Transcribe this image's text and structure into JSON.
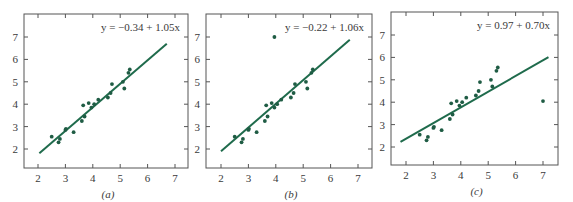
{
  "chart_data": [
    {
      "type": "scatter",
      "panel_label": "(a)",
      "title": "",
      "annotation": "y = −0.34 + 1.05x",
      "xlabel": "",
      "ylabel": "",
      "xlim": [
        1.5,
        7.5
      ],
      "ylim": [
        1.2,
        8.0
      ],
      "xticks": [
        2,
        3,
        4,
        5,
        6,
        7
      ],
      "yticks": [
        2,
        3,
        4,
        5,
        6,
        7
      ],
      "grid": false,
      "fit_line": {
        "intercept": -0.34,
        "slope": 1.05,
        "x_range": [
          2.05,
          6.7
        ]
      },
      "points": [
        [
          2.5,
          2.55
        ],
        [
          2.75,
          2.3
        ],
        [
          2.8,
          2.45
        ],
        [
          3.0,
          2.85
        ],
        [
          3.02,
          2.9
        ],
        [
          3.3,
          2.75
        ],
        [
          3.6,
          3.25
        ],
        [
          3.65,
          3.95
        ],
        [
          3.7,
          3.45
        ],
        [
          3.85,
          4.05
        ],
        [
          3.95,
          3.85
        ],
        [
          4.05,
          4.0
        ],
        [
          4.2,
          4.2
        ],
        [
          4.55,
          4.3
        ],
        [
          4.65,
          4.5
        ],
        [
          4.7,
          4.9
        ],
        [
          5.1,
          5.0
        ],
        [
          5.15,
          4.7
        ],
        [
          5.3,
          5.4
        ],
        [
          5.35,
          5.55
        ]
      ]
    },
    {
      "type": "scatter",
      "panel_label": "(b)",
      "title": "",
      "annotation": "y = −0.22 + 1.06x",
      "xlabel": "",
      "ylabel": "",
      "xlim": [
        1.5,
        7.5
      ],
      "ylim": [
        1.2,
        8.0
      ],
      "xticks": [
        2,
        3,
        4,
        5,
        6,
        7
      ],
      "yticks": [
        2,
        3,
        4,
        5,
        6,
        7
      ],
      "grid": false,
      "fit_line": {
        "intercept": -0.22,
        "slope": 1.06,
        "x_range": [
          2.0,
          6.7
        ]
      },
      "points": [
        [
          2.5,
          2.55
        ],
        [
          2.75,
          2.3
        ],
        [
          2.8,
          2.45
        ],
        [
          3.0,
          2.85
        ],
        [
          3.02,
          2.9
        ],
        [
          3.3,
          2.75
        ],
        [
          3.6,
          3.25
        ],
        [
          3.65,
          3.95
        ],
        [
          3.7,
          3.45
        ],
        [
          3.85,
          4.05
        ],
        [
          3.95,
          3.85
        ],
        [
          4.05,
          4.0
        ],
        [
          4.2,
          4.2
        ],
        [
          4.55,
          4.3
        ],
        [
          4.65,
          4.5
        ],
        [
          4.7,
          4.9
        ],
        [
          5.1,
          5.0
        ],
        [
          5.15,
          4.7
        ],
        [
          5.3,
          5.4
        ],
        [
          5.35,
          5.55
        ],
        [
          3.95,
          7.0
        ]
      ]
    },
    {
      "type": "scatter",
      "panel_label": "(c)",
      "title": "",
      "annotation": "y = 0.97 + 0.70x",
      "xlabel": "",
      "ylabel": "",
      "xlim": [
        1.5,
        7.5
      ],
      "ylim": [
        1.2,
        8.0
      ],
      "xticks": [
        2,
        3,
        4,
        5,
        6,
        7
      ],
      "yticks": [
        2,
        3,
        4,
        5,
        6,
        7
      ],
      "grid": false,
      "fit_line": {
        "intercept": 0.97,
        "slope": 0.7,
        "x_range": [
          1.8,
          7.2
        ]
      },
      "points": [
        [
          2.5,
          2.55
        ],
        [
          2.75,
          2.3
        ],
        [
          2.8,
          2.45
        ],
        [
          3.0,
          2.85
        ],
        [
          3.02,
          2.9
        ],
        [
          3.3,
          2.75
        ],
        [
          3.6,
          3.25
        ],
        [
          3.65,
          3.95
        ],
        [
          3.7,
          3.45
        ],
        [
          3.85,
          4.05
        ],
        [
          3.95,
          3.85
        ],
        [
          4.05,
          4.0
        ],
        [
          4.2,
          4.2
        ],
        [
          4.55,
          4.3
        ],
        [
          4.65,
          4.5
        ],
        [
          4.7,
          4.9
        ],
        [
          5.1,
          5.0
        ],
        [
          5.15,
          4.7
        ],
        [
          5.3,
          5.4
        ],
        [
          5.35,
          5.55
        ],
        [
          7.0,
          4.05
        ]
      ]
    }
  ],
  "colors": {
    "fit_line": "#1f6b4c",
    "points": "#1f5c44",
    "axes": "#555555",
    "text": "#3a3a3a"
  }
}
